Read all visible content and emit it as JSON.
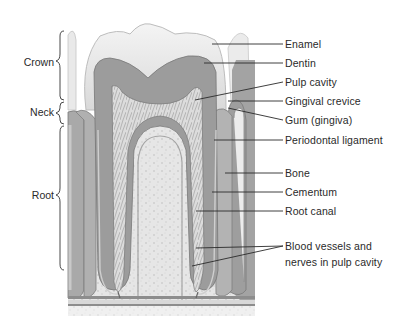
{
  "figure": {
    "regions": [
      {
        "label": "Crown",
        "y": 56
      },
      {
        "label": "Neck",
        "y": 106
      },
      {
        "label": "Root",
        "y": 189
      }
    ],
    "labels": [
      {
        "text": "Enamel",
        "y": 38
      },
      {
        "text": "Dentin",
        "y": 57
      },
      {
        "text": "Pulp cavity",
        "y": 76
      },
      {
        "text": "Gingival crevice",
        "y": 95
      },
      {
        "text": "Gum (gingiva)",
        "y": 114
      },
      {
        "text": "Periodontal ligament",
        "y": 134
      },
      {
        "text": "Bone",
        "y": 167
      },
      {
        "text": "Cementum",
        "y": 186
      },
      {
        "text": "Root canal",
        "y": 205
      },
      {
        "text": "Blood vessels and nerves in pulp cavity",
        "y": 240
      }
    ],
    "colors": {
      "background": "#ffffff",
      "enamel": "#ededed",
      "dentin": "#9a9a9a",
      "pulp": "#d6d6d6",
      "bone": "#e4e4e4",
      "line": "#2a2a2a"
    }
  }
}
